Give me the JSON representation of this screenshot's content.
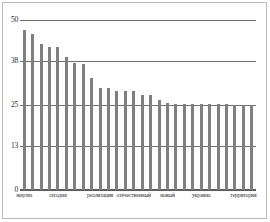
{
  "chart_data": {
    "type": "bar",
    "title": "",
    "subtitle": "",
    "xlabel": "",
    "ylabel": "",
    "ylim": [
      0,
      50
    ],
    "yticks": [
      0,
      13,
      25,
      38,
      50
    ],
    "ytick_labels": [
      "0",
      "13",
      "25",
      "38",
      "50"
    ],
    "grid": true,
    "gridlines_at": [
      13,
      25,
      38,
      50
    ],
    "legend": null,
    "bar_color": "#7f7f7f",
    "gridline_color": "#6e6e6e",
    "axis_color": "#5d5d5d",
    "background": "#ffffff",
    "n_bars": 28,
    "categories": [
      "жертва",
      "",
      "",
      "",
      "сегодня",
      "",
      "",
      "",
      "",
      "реализация",
      "",
      "отечественный",
      "",
      "",
      "",
      "",
      "новый",
      "",
      "",
      "",
      "украина",
      "",
      "",
      "",
      "",
      "территория",
      "",
      ""
    ],
    "values": [
      47,
      46,
      43,
      42,
      42,
      39,
      37.5,
      37,
      33,
      30,
      30,
      29,
      29,
      29,
      28,
      28,
      26.5,
      25.5,
      25.2,
      25.2,
      25.2,
      25.2,
      25.2,
      25.2,
      25.2,
      25,
      25,
      25
    ],
    "visible_xtick_labels": [
      {
        "label": "жертва",
        "bar_index": 0
      },
      {
        "label": "сегодня",
        "bar_index": 4
      },
      {
        "label": "реализация",
        "bar_index": 9
      },
      {
        "label": "отечественный",
        "bar_index": 13
      },
      {
        "label": "новый",
        "bar_index": 17
      },
      {
        "label": "украина",
        "bar_index": 21
      },
      {
        "label": "территория",
        "bar_index": 26
      }
    ]
  }
}
